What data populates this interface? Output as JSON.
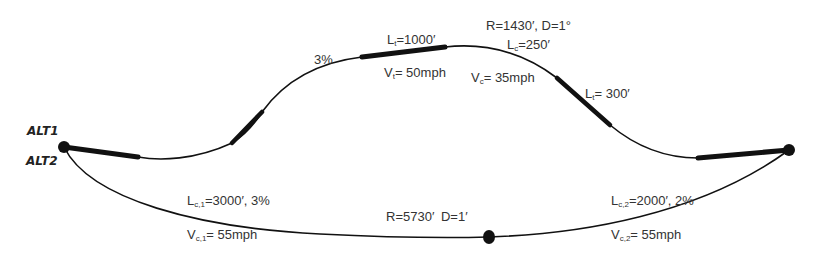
{
  "diagram": {
    "type": "highway-alignment-alternatives",
    "colors": {
      "line": "#111111",
      "text": "#333333",
      "background": "#ffffff"
    },
    "alternatives": [
      {
        "id": "alt1",
        "label": "ALT1"
      },
      {
        "id": "alt2",
        "label": "ALT2"
      }
    ],
    "alt1_labels": {
      "grade": "3%",
      "tangent_length": {
        "sym": "L",
        "sub": "t",
        "val": "=1000′"
      },
      "tangent_speed": {
        "sym": "V",
        "sub": "t",
        "val": "= 50mph"
      },
      "curve_params": "R=1430′, D=1°",
      "curve_length": {
        "sym": "L",
        "sub": "c",
        "val": "=250′"
      },
      "curve_speed": {
        "sym": "V",
        "sub": "c",
        "val": "= 35mph"
      },
      "tangent2_length": {
        "sym": "L",
        "sub": "t",
        "val": "= 300′"
      }
    },
    "alt2_labels": {
      "curve1_length": {
        "sym": "L",
        "sub": "c,1",
        "val": "=3000′, 3%"
      },
      "curve1_speed": {
        "sym": "V",
        "sub": "c,1",
        "val": "= 55mph"
      },
      "curve_params": "R=5730′  D=1′",
      "curve2_length": {
        "sym": "L",
        "sub": "c,2",
        "val": "=2000′, 2%"
      },
      "curve2_speed": {
        "sym": "V",
        "sub": "c,2",
        "val": "= 55mph"
      }
    },
    "nodes": [
      {
        "name": "start-node",
        "x": 64,
        "y": 147
      },
      {
        "name": "end-node",
        "x": 789,
        "y": 150
      },
      {
        "name": "alt2-mid-node",
        "x": 489,
        "y": 237
      }
    ]
  }
}
